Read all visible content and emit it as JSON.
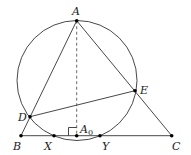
{
  "diagram": {
    "points": [
      {
        "id": "A",
        "label": "A"
      },
      {
        "id": "B",
        "label": "B"
      },
      {
        "id": "C",
        "label": "C"
      },
      {
        "id": "D",
        "label": "D"
      },
      {
        "id": "E",
        "label": "E"
      },
      {
        "id": "X",
        "label": "X"
      },
      {
        "id": "Y",
        "label": "Y"
      },
      {
        "id": "A0",
        "label": "A",
        "subscript": "0"
      }
    ],
    "segments": [
      "AB",
      "AC",
      "BC",
      "DE"
    ],
    "dashed_segments": [
      "AA0"
    ],
    "right_angle_at": "A0",
    "circle": "through A, D, E, X, Y"
  }
}
